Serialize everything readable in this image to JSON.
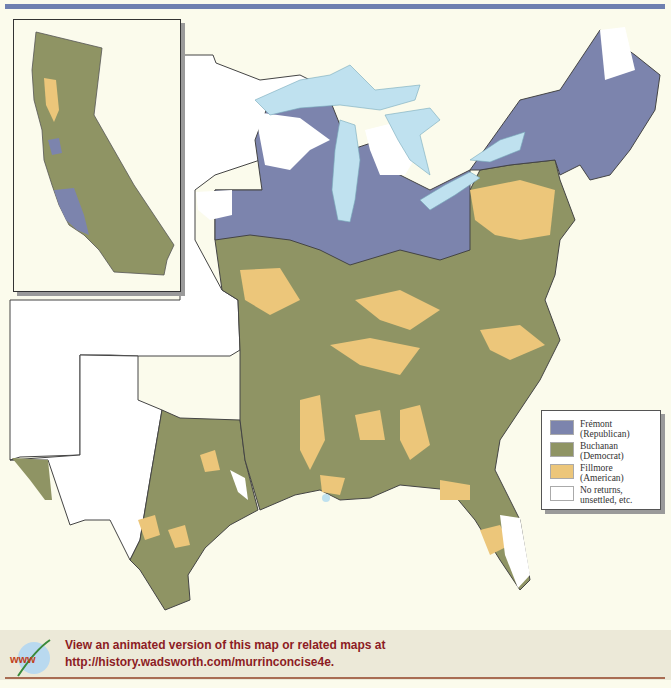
{
  "map": {
    "subject": "1856 presidential election results by county",
    "colors": {
      "fremont": "#7c84ad",
      "buchanan": "#8f9464",
      "fillmore": "#ecc67a",
      "no_returns": "#ffffff",
      "water": "#bfe1ef",
      "background": "#fbfbec",
      "band": "#6f80b0"
    },
    "inset": {
      "label": "California"
    }
  },
  "legend": {
    "items": [
      {
        "label": "Frémont\n(Republican)",
        "color": "#7c84ad"
      },
      {
        "label": "Buchanan\n(Democrat)",
        "color": "#8f9464"
      },
      {
        "label": "Fillmore\n(American)",
        "color": "#ecc67a"
      },
      {
        "label": "No returns,\nunsettled, etc.",
        "color": "#ffffff"
      }
    ]
  },
  "footer": {
    "icon": "www-globe-icon",
    "icon_text": "www",
    "line1": "View an animated version of this map or related maps at",
    "line2": "http://history.wadsworth.com/murrinconcise4e."
  }
}
